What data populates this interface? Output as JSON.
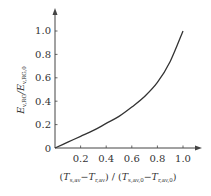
{
  "chart_data": {
    "type": "line",
    "title": "",
    "xlabel": "(T_s,av − T_r,av) / (T_s,av,0 − T_r,av,0)",
    "ylabel": "E_v,RG / E_v,RG,0",
    "xlim": [
      0,
      1.0
    ],
    "ylim": [
      0,
      1.0
    ],
    "grid": false,
    "legend": null,
    "x_ticks": [
      "0.2",
      "0.4",
      "0.6",
      "0.8",
      "1.0"
    ],
    "y_ticks": [
      "0",
      "0.2",
      "0.4",
      "0.6",
      "0.8",
      "1.0"
    ],
    "series": [
      {
        "name": "ratio",
        "x": [
          0,
          0.1,
          0.2,
          0.3,
          0.4,
          0.5,
          0.6,
          0.7,
          0.8,
          0.9,
          1.0
        ],
        "values": [
          0,
          0.05,
          0.1,
          0.15,
          0.21,
          0.27,
          0.35,
          0.44,
          0.56,
          0.74,
          1.0
        ]
      }
    ]
  },
  "axes": {
    "x_tick_labels": [
      "0.2",
      "0.4",
      "0.6",
      "0.8",
      "1.0"
    ],
    "y_tick_labels": [
      "0",
      "0.2",
      "0.4",
      "0.6",
      "0.8",
      "1.0"
    ],
    "xlabel": {
      "open": "(",
      "t1": "T",
      "t1_sub": "s,av",
      "minus1": "−",
      "t2": "T",
      "t2_sub": "r,av",
      "mid": ") / (",
      "t3": "T",
      "t3_sub": "s,av,0",
      "minus2": "−",
      "t4": "T",
      "t4_sub": "r,av,0",
      "close": ")"
    },
    "ylabel": {
      "e1": "E",
      "e1_sub": "v,RG",
      "slash": "/",
      "e2": "E",
      "e2_sub": "v,RG,0"
    }
  },
  "colors": {
    "axis": "#444444",
    "curve": "#333333",
    "text": "#333333"
  }
}
